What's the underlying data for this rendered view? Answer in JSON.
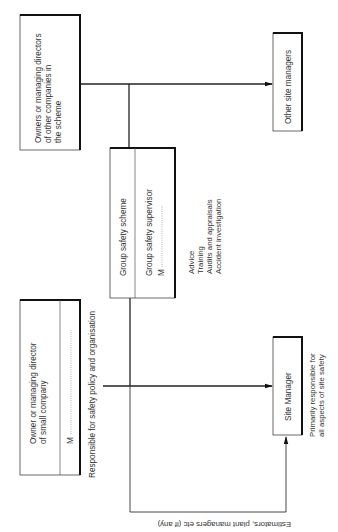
{
  "diagram": {
    "orientation": "rotated-90-ccw",
    "other_companies_box": {
      "lines": [
        "Owners or managing directors",
        "of other companies in",
        "the scheme"
      ]
    },
    "other_site_managers_box": {
      "label": "Other site managers"
    },
    "group_scheme_box": {
      "title": "Group safety scheme",
      "supervisor_label": "Group safety supervisor",
      "name_prefix": "M"
    },
    "group_duties": [
      "Advice",
      "Training",
      "Audits and appraisals",
      "Accident investigation"
    ],
    "small_company_box": {
      "lines": [
        "Owner or managing director",
        "of small company"
      ],
      "name_prefix": "M"
    },
    "responsibility_label": "Responsible for safety policy and organisation",
    "site_manager_box": {
      "label": "Site Manager"
    },
    "site_manager_note": [
      "Primarily responsible for",
      "all aspects of site safety"
    ],
    "estimators_label": "Estimators, plant managers etc (if any)"
  }
}
